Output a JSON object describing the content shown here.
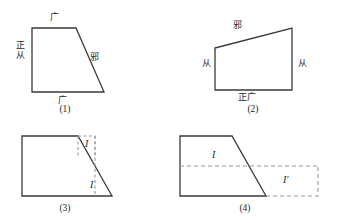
{
  "diagram": {
    "stroke_color": "#3a3a3a",
    "dashed_color": "#9a9a9a",
    "background": "#ffffff",
    "figures": [
      {
        "id": "fig1",
        "caption": "(1)",
        "labels": {
          "top": "广",
          "left": "正从",
          "right": "邪",
          "bottom": "广"
        }
      },
      {
        "id": "fig2",
        "caption": "(2)",
        "labels": {
          "top": "邪",
          "left": "从",
          "right": "从",
          "bottom": "正广"
        }
      },
      {
        "id": "fig3",
        "caption": "(3)",
        "labels": {
          "upper": "I",
          "lower": "I"
        }
      },
      {
        "id": "fig4",
        "caption": "(4)",
        "labels": {
          "inner": "I",
          "outer": "I′"
        }
      }
    ]
  }
}
